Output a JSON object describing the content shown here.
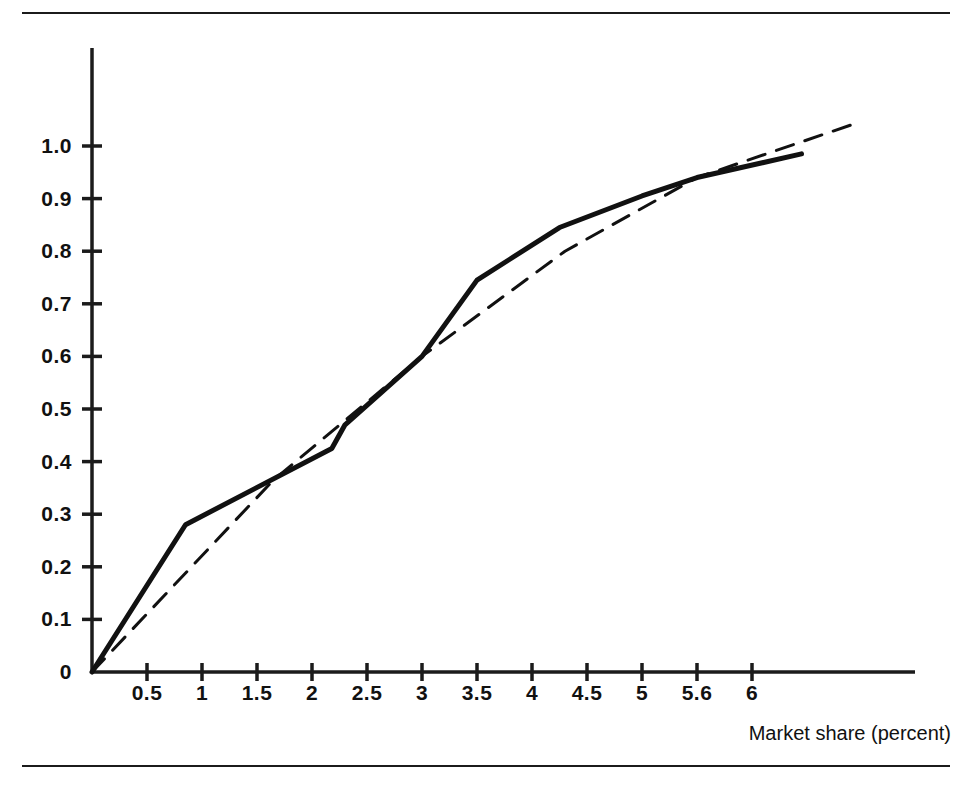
{
  "figure": {
    "background_color": "#ffffff",
    "ink_color": "#1b1b1b",
    "top_rule": "horizontal-rule",
    "bottom_rule": "horizontal-rule"
  },
  "chart_data": {
    "type": "line",
    "title": "",
    "subtitle": "",
    "xlabel": "Market share (percent)",
    "ylabel": "",
    "xlim": [
      0,
      7.0
    ],
    "ylim": [
      0,
      1.12
    ],
    "grid": false,
    "legend": "none",
    "x_tick_labels": [
      "0.5",
      "1",
      "1.5",
      "2",
      "2.5",
      "3",
      "3.5",
      "4",
      "4.5",
      "5",
      "5.6",
      "6"
    ],
    "x_tick_values": [
      0.5,
      1,
      1.5,
      2,
      2.5,
      3,
      3.5,
      4,
      4.5,
      5,
      5.5,
      6
    ],
    "y_tick_labels": [
      "0",
      "0.1",
      "0.2",
      "0.3",
      "0.4",
      "0.5",
      "0.6",
      "0.7",
      "0.8",
      "0.9",
      "1.0"
    ],
    "y_tick_values": [
      0,
      0.1,
      0.2,
      0.3,
      0.4,
      0.5,
      0.6,
      0.7,
      0.8,
      0.9,
      1.0
    ],
    "series": [
      {
        "name": "observed-curve",
        "style": "solid",
        "line_width": 5,
        "color": "#111111",
        "points": [
          [
            0.0,
            0.0
          ],
          [
            0.85,
            0.28
          ],
          [
            2.18,
            0.425
          ],
          [
            2.3,
            0.47
          ],
          [
            3.0,
            0.6
          ],
          [
            3.5,
            0.745
          ],
          [
            4.25,
            0.845
          ],
          [
            5.0,
            0.905
          ],
          [
            5.5,
            0.94
          ],
          [
            6.45,
            0.985
          ]
        ]
      },
      {
        "name": "reference-curve",
        "style": "dashed",
        "line_width": 3,
        "color": "#111111",
        "dash_pattern": "18 12",
        "points": [
          [
            0.0,
            0.0
          ],
          [
            1.65,
            0.365
          ],
          [
            3.0,
            0.6
          ],
          [
            4.3,
            0.8
          ],
          [
            5.5,
            0.94
          ],
          [
            6.9,
            1.04
          ]
        ]
      }
    ]
  }
}
